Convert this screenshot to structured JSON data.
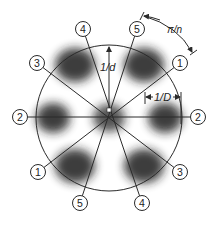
{
  "diagram": {
    "type": "diffraction-pattern",
    "colors": {
      "line": "#2a2a2a",
      "spot": "#1e1e1e",
      "background": "#ffffff"
    },
    "annotations": {
      "inner_spacing_label": "1/d",
      "spot_width_label": "1/D",
      "angle_label": "π/n"
    },
    "lines": [
      {
        "id": "1",
        "label_a": "1",
        "label_b": "1"
      },
      {
        "id": "2",
        "label_a": "2",
        "label_b": "2"
      },
      {
        "id": "3",
        "label_a": "3",
        "label_b": "3"
      },
      {
        "id": "4",
        "label_a": "4",
        "label_b": "4"
      },
      {
        "id": "5",
        "label_a": "5",
        "label_b": "5"
      }
    ],
    "spot_count": 8,
    "central_spot": true
  }
}
